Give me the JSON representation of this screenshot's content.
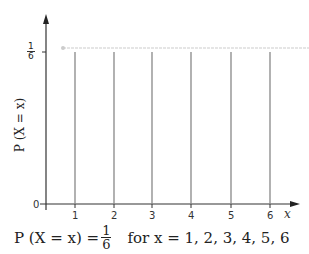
{
  "chart_data": {
    "type": "bar",
    "title": "",
    "xlabel": "x",
    "ylabel": "P (X = x)",
    "categories": [
      "1",
      "2",
      "3",
      "4",
      "5",
      "6"
    ],
    "values": [
      0.1667,
      0.1667,
      0.1667,
      0.1667,
      0.1667,
      0.1667
    ],
    "y_ticks": [
      {
        "label": "0",
        "value": 0
      },
      {
        "label": "1/6",
        "value": 0.1667
      }
    ],
    "ylim": [
      0,
      0.18
    ],
    "reference_line": {
      "value": 0.1667,
      "style": "dashed",
      "color": "#cccccc"
    },
    "grid": false,
    "legend": null
  },
  "caption": {
    "lhs": "P (X = x) =",
    "frac_num": "1",
    "frac_den": "6",
    "rhs": "for x = 1, 2, 3, 4, 5, 6"
  },
  "axis": {
    "ylabel": "P (X = x)",
    "xlabel": "x",
    "zero": "0",
    "top_num": "1",
    "top_den": "6",
    "xticks": [
      "1",
      "2",
      "3",
      "4",
      "5",
      "6"
    ]
  },
  "colors": {
    "axis": "#333333",
    "bar": "#888888",
    "dashed": "#cccccc"
  }
}
